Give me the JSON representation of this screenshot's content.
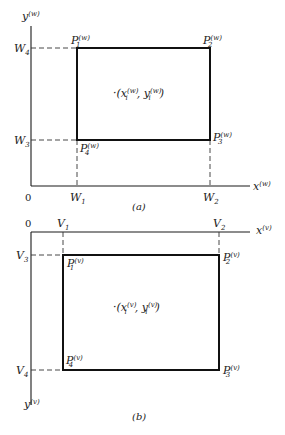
{
  "figure_a": {
    "caption": "(a)",
    "origin_label": "0",
    "x_axis_label": "x",
    "x_axis_sup": "(w)",
    "y_axis_label": "y",
    "y_axis_sup": "(w)",
    "x_ticks": [
      {
        "label": "W",
        "sub": "1"
      },
      {
        "label": "W",
        "sub": "2"
      }
    ],
    "y_ticks": [
      {
        "label": "W",
        "sub": "4"
      },
      {
        "label": "W",
        "sub": "3"
      }
    ],
    "corners": [
      {
        "label": "P",
        "sub": "1",
        "sup": "(w)"
      },
      {
        "label": "P",
        "sub": "2",
        "sup": "(w)"
      },
      {
        "label": "P",
        "sub": "3",
        "sup": "(w)"
      },
      {
        "label": "P",
        "sub": "4",
        "sup": "(w)"
      }
    ],
    "point": {
      "prefix": "·(",
      "x": "x",
      "x_sub": "i",
      "x_sup": "(w)",
      "sep": ", ",
      "y": "y",
      "y_sub": "i",
      "y_sup": "(w)",
      "suffix": ")"
    }
  },
  "figure_b": {
    "caption": "(b)",
    "origin_label": "0",
    "x_axis_label": "x",
    "x_axis_sup": "(v)",
    "y_axis_label": "y",
    "y_axis_sup": "(v)",
    "x_ticks": [
      {
        "label": "V",
        "sub": "1"
      },
      {
        "label": "V",
        "sub": "2"
      }
    ],
    "y_ticks": [
      {
        "label": "V",
        "sub": "3"
      },
      {
        "label": "V",
        "sub": "4"
      }
    ],
    "corners": [
      {
        "label": "P",
        "sub": "1",
        "sup": "(v)"
      },
      {
        "label": "P",
        "sub": "2",
        "sup": "(v)"
      },
      {
        "label": "P",
        "sub": "3",
        "sup": "(v)"
      },
      {
        "label": "P",
        "sub": "4",
        "sup": "(v)"
      }
    ],
    "point": {
      "prefix": "·(",
      "x": "x",
      "x_sub": "i",
      "x_sup": "(v)",
      "sep": ", ",
      "y": "y",
      "y_sub": "i",
      "y_sup": "(v)",
      "suffix": ")"
    }
  }
}
